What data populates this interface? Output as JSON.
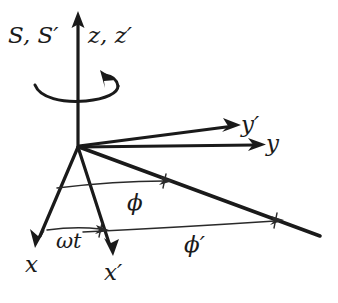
{
  "figure": {
    "background_color": "#ffffff",
    "ink_color": "#1a1a1a",
    "width": 338,
    "height": 303
  },
  "labels": {
    "frames": "S, S′",
    "z_axis": "z, z′",
    "y_prime_axis": "y′",
    "y_axis": "y",
    "x_axis": "x",
    "x_prime_axis": "x′",
    "omega_t": "ωt",
    "phi": "ϕ",
    "phi_prime": "ϕ′"
  },
  "geometry": {
    "origin": {
      "x": 78,
      "y": 146
    },
    "axes": [
      {
        "name": "z",
        "label": "z, z′",
        "from": [
          78,
          146
        ],
        "to": [
          78,
          16
        ],
        "arrow": true
      },
      {
        "name": "y-prime",
        "label": "y′",
        "from": [
          78,
          146
        ],
        "to": [
          236,
          126
        ],
        "arrow": true
      },
      {
        "name": "y",
        "label": "y",
        "from": [
          78,
          146
        ],
        "to": [
          261,
          145
        ],
        "arrow": true
      },
      {
        "name": "x",
        "label": "x",
        "from": [
          78,
          146
        ],
        "to": [
          37,
          243
        ],
        "arrow": true
      },
      {
        "name": "x-prime",
        "label": "x′",
        "from": [
          78,
          146
        ],
        "to": [
          112,
          251
        ],
        "arrow": true
      },
      {
        "name": "radial-direction",
        "label": "",
        "from": [
          78,
          146
        ],
        "to": [
          320,
          236
        ],
        "arrow": false
      }
    ],
    "angle_arcs": [
      {
        "name": "omega-t",
        "label": "ωt",
        "from": [
          47,
          230
        ],
        "to": [
          106,
          230
        ]
      },
      {
        "name": "phi",
        "label": "ϕ",
        "from": [
          57,
          188
        ],
        "to": [
          171,
          181
        ]
      },
      {
        "name": "phi-prime",
        "label": "ϕ′",
        "from": [
          83,
          232
        ],
        "to": [
          282,
          221
        ]
      }
    ],
    "rotation_arrow": {
      "name": "rotation-about-z",
      "center": [
        78,
        88
      ],
      "rx": 46,
      "ry": 11,
      "direction": "counterclockwise"
    }
  }
}
